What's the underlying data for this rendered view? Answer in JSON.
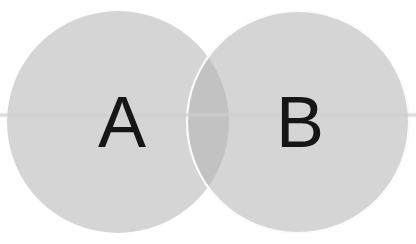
{
  "diagram": {
    "type": "venn",
    "background_color": "#ffffff",
    "set_fill_color": "#d5d5d5",
    "overlap_fill_color": "#c2c2c2",
    "separator_stroke_color": "#fbfbfb",
    "label_color": "#161616",
    "seam_line_color": "#cfcfcf",
    "sets": [
      {
        "id": "set-a",
        "label": "A",
        "cx": 118,
        "cy": 122,
        "r": 111,
        "label_x": 122,
        "label_y": 122,
        "label_size": 72
      },
      {
        "id": "set-b",
        "label": "B",
        "cx": 298,
        "cy": 122,
        "r": 111,
        "label_x": 300,
        "label_y": 122,
        "label_size": 72
      }
    ],
    "intersection": {
      "id": "set-ab",
      "label": "",
      "cusp_top_x": 208,
      "cusp_top_y": 32,
      "cusp_bottom_x": 208,
      "cusp_bottom_y": 212
    }
  }
}
